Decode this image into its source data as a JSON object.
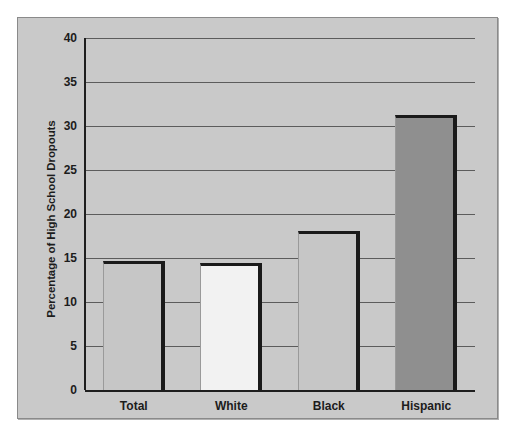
{
  "chart_data": {
    "type": "bar",
    "title": "",
    "xlabel": "",
    "ylabel": "Percentage of High School Dropouts",
    "categories": [
      "Total",
      "White",
      "Black",
      "Hispanic"
    ],
    "values": [
      14.7,
      14.4,
      18.1,
      31.3
    ],
    "ylim": [
      0,
      40
    ],
    "yticks": [
      "0",
      "5",
      "10",
      "15",
      "20",
      "25",
      "30",
      "35",
      "40"
    ],
    "ytick_values": [
      0,
      5,
      10,
      15,
      20,
      25,
      30,
      35,
      40
    ],
    "grid": true,
    "legend": false,
    "bar_colors": [
      "#c6c6c6",
      "#f2f2f2",
      "#c6c6c6",
      "#8f8f8f"
    ],
    "plot_background": "#c9c9c9",
    "gridline_color": "#5c5c5c",
    "bar_edge_color": "#1a1a1a",
    "axis_color": "#1e1e1e",
    "frame_border_color": "#8a8a8a",
    "page_background": "#ffffff"
  }
}
